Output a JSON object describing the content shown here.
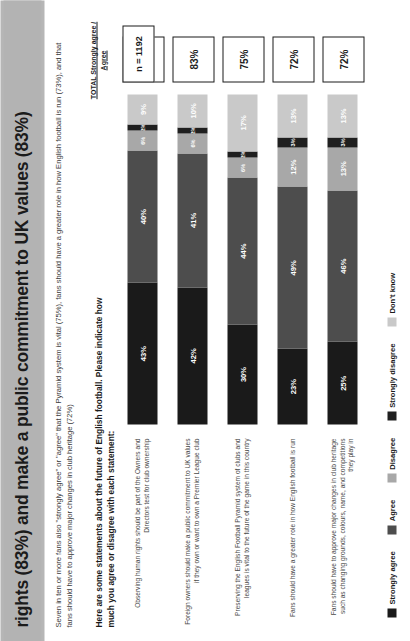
{
  "title": "rights (83%) and make a public commitment to UK values (83%)",
  "subtitle": "Seven in ten or more fans also \"strongly agree\" or \"agree\" that the Pyramid system is vital (75%), fans should have a greater role in how English football is run (73%), and that fans should have to approve major changes in club heritage (72%)",
  "question": "Here are some statements about the future of English football.  Please indicate how much you agree or disagree with each statement:",
  "total_header": "TOTAL Strongly agree / Agree",
  "sample_size": "n = 1192",
  "legend": [
    {
      "label": "Strongly agree",
      "color": "#1a1a1a"
    },
    {
      "label": "Agree",
      "color": "#4d4d4d"
    },
    {
      "label": "Disagree",
      "color": "#a8a8a8"
    },
    {
      "label": "Strongly disagree",
      "color": "#1f1f1f"
    },
    {
      "label": "Don't know",
      "color": "#c9c9c9"
    }
  ],
  "chart_data": {
    "type": "bar",
    "subtype": "stacked-horizontal-100",
    "title": "rights (83%) and make a public commitment to UK values (83%)",
    "xlabel": "",
    "ylabel": "",
    "xlim": [
      0,
      100
    ],
    "grid": false,
    "legend_position": "bottom",
    "categories": [
      "Observing human rights should be part of the Owners and Directors test for club ownership",
      "Foreign owners should make a public commitment to UK values if they own or want to own a Premier League club",
      "Preserving the English Football Pyramid system of clubs and leagues is vital to the future of the game in this country",
      "Fans should have a greater role in how English football is run",
      "Fans should have to approve major changes in club heritage such as changing grounds, colours, name, and competitions they play in"
    ],
    "series": [
      {
        "name": "Strongly agree",
        "values": [
          43,
          42,
          30,
          23,
          25
        ]
      },
      {
        "name": "Agree",
        "values": [
          40,
          41,
          44,
          49,
          46
        ]
      },
      {
        "name": "Disagree",
        "values": [
          6,
          6,
          6,
          12,
          13
        ]
      },
      {
        "name": "Strongly disagree",
        "values": [
          2,
          2,
          2,
          3,
          3
        ]
      },
      {
        "name": "Don't know",
        "values": [
          9,
          10,
          17,
          13,
          13
        ]
      }
    ],
    "totals": [
      "83%",
      "83%",
      "75%",
      "72%",
      "72%"
    ],
    "sample_size": "n = 1192"
  },
  "rows": [
    {
      "label": "Observing human rights should be part of the Owners and Directors test for club ownership",
      "total": "83%",
      "segments": [
        {
          "label": "43%",
          "value": 43
        },
        {
          "label": "40%",
          "value": 40
        },
        {
          "label": "6%",
          "value": 6
        },
        {
          "label": "2%",
          "value": 2
        },
        {
          "label": "9%",
          "value": 9
        }
      ]
    },
    {
      "label": "Foreign owners should make a public commitment to UK values if they own or want to own a Premier League club",
      "total": "83%",
      "segments": [
        {
          "label": "42%",
          "value": 42
        },
        {
          "label": "41%",
          "value": 41
        },
        {
          "label": "6%",
          "value": 6
        },
        {
          "label": "2%",
          "value": 2
        },
        {
          "label": "10%",
          "value": 10
        }
      ]
    },
    {
      "label": "Preserving the English Football Pyramid system of clubs and leagues is vital to the future of the game in this country",
      "total": "75%",
      "segments": [
        {
          "label": "30%",
          "value": 30
        },
        {
          "label": "44%",
          "value": 44
        },
        {
          "label": "6%",
          "value": 6
        },
        {
          "label": "2%",
          "value": 2
        },
        {
          "label": "17%",
          "value": 17
        }
      ]
    },
    {
      "label": "Fans should have a greater role in how English football is run",
      "total": "72%",
      "segments": [
        {
          "label": "23%",
          "value": 23
        },
        {
          "label": "49%",
          "value": 49
        },
        {
          "label": "12%",
          "value": 12
        },
        {
          "label": "3%",
          "value": 3
        },
        {
          "label": "13%",
          "value": 13
        }
      ]
    },
    {
      "label": "Fans should have to approve major changes in club heritage such as changing grounds, colours, name, and competitions they play in",
      "total": "72%",
      "segments": [
        {
          "label": "25%",
          "value": 25
        },
        {
          "label": "46%",
          "value": 46
        },
        {
          "label": "13%",
          "value": 13
        },
        {
          "label": "3%",
          "value": 3
        },
        {
          "label": "13%",
          "value": 13
        }
      ]
    }
  ]
}
